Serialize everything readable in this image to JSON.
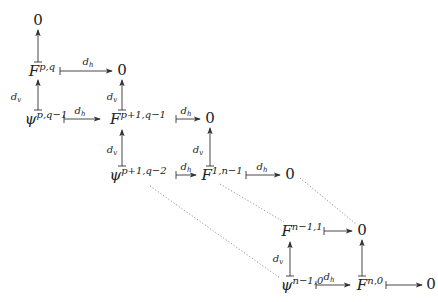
{
  "diagram": {
    "nodes": [
      {
        "id": "n0",
        "base": "0",
        "sup": "",
        "x": 38,
        "y": 22,
        "zero": true
      },
      {
        "id": "Fpq",
        "base": "F",
        "sup": "p,q",
        "x": 42,
        "y": 72
      },
      {
        "id": "n1",
        "base": "0",
        "sup": "",
        "x": 122,
        "y": 72,
        "zero": true
      },
      {
        "id": "psi_pq1",
        "base": "ψ",
        "sup": "p,q−1",
        "x": 46,
        "y": 120
      },
      {
        "id": "Fp1q1",
        "base": "F",
        "sup": "p+1,q−1",
        "x": 138,
        "y": 120
      },
      {
        "id": "n2",
        "base": "0",
        "sup": "",
        "x": 210,
        "y": 120,
        "zero": true
      },
      {
        "id": "psi_p1q2",
        "base": "ψ",
        "sup": "p+1,q−2",
        "x": 138,
        "y": 176
      },
      {
        "id": "F1n1",
        "base": "F",
        "sup": "1,n−1",
        "x": 222,
        "y": 176
      },
      {
        "id": "n3",
        "base": "0",
        "sup": "",
        "x": 290,
        "y": 176,
        "zero": true
      },
      {
        "id": "Fn11",
        "base": "F",
        "sup": "n−1,1",
        "x": 302,
        "y": 232
      },
      {
        "id": "n4",
        "base": "0",
        "sup": "",
        "x": 362,
        "y": 232,
        "zero": true
      },
      {
        "id": "psi_n10",
        "base": "ψ",
        "sup": "n−1,0",
        "x": 302,
        "y": 286
      },
      {
        "id": "Fn0",
        "base": "F",
        "sup": "n,0",
        "x": 370,
        "y": 286
      },
      {
        "id": "n5",
        "base": "0",
        "sup": "",
        "x": 431,
        "y": 286,
        "zero": true
      }
    ],
    "labels": [
      {
        "text": "d",
        "sub": "h",
        "x": 88,
        "y": 62
      },
      {
        "text": "d",
        "sub": "v",
        "x": 16,
        "y": 97
      },
      {
        "text": "d",
        "sub": "v",
        "x": 112,
        "y": 97
      },
      {
        "text": "d",
        "sub": "h",
        "x": 80,
        "y": 111
      },
      {
        "text": "d",
        "sub": "h",
        "x": 186,
        "y": 111
      },
      {
        "text": "d",
        "sub": "v",
        "x": 112,
        "y": 150
      },
      {
        "text": "d",
        "sub": "v",
        "x": 198,
        "y": 150
      },
      {
        "text": "d",
        "sub": "h",
        "x": 186,
        "y": 167
      },
      {
        "text": "d",
        "sub": "h",
        "x": 262,
        "y": 167
      },
      {
        "text": "d",
        "sub": "v",
        "x": 278,
        "y": 259
      },
      {
        "text": "d",
        "sub": "h",
        "x": 329,
        "y": 277
      }
    ],
    "arrows": [
      {
        "x1": 38,
        "y1": 62,
        "x2": 38,
        "y2": 30
      },
      {
        "x1": 60,
        "y1": 71,
        "x2": 112,
        "y2": 71
      },
      {
        "x1": 38,
        "y1": 110,
        "x2": 38,
        "y2": 80
      },
      {
        "x1": 122,
        "y1": 110,
        "x2": 122,
        "y2": 80
      },
      {
        "x1": 64,
        "y1": 119,
        "x2": 100,
        "y2": 119
      },
      {
        "x1": 176,
        "y1": 119,
        "x2": 200,
        "y2": 119
      },
      {
        "x1": 122,
        "y1": 166,
        "x2": 122,
        "y2": 130
      },
      {
        "x1": 210,
        "y1": 166,
        "x2": 210,
        "y2": 128
      },
      {
        "x1": 176,
        "y1": 175,
        "x2": 196,
        "y2": 175
      },
      {
        "x1": 246,
        "y1": 175,
        "x2": 280,
        "y2": 175
      },
      {
        "x1": 324,
        "y1": 231,
        "x2": 352,
        "y2": 231
      },
      {
        "x1": 290,
        "y1": 276,
        "x2": 290,
        "y2": 242
      },
      {
        "x1": 362,
        "y1": 276,
        "x2": 362,
        "y2": 240
      },
      {
        "x1": 316,
        "y1": 285,
        "x2": 350,
        "y2": 285
      },
      {
        "x1": 386,
        "y1": 285,
        "x2": 422,
        "y2": 285
      }
    ],
    "dotted": [
      {
        "x1": 300,
        "y1": 178,
        "x2": 356,
        "y2": 224
      },
      {
        "x1": 220,
        "y1": 184,
        "x2": 284,
        "y2": 222
      },
      {
        "x1": 150,
        "y1": 186,
        "x2": 280,
        "y2": 278
      }
    ]
  }
}
